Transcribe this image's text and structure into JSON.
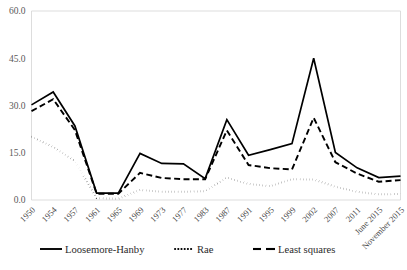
{
  "chart_data": {
    "type": "line",
    "title": "",
    "subtitle": "",
    "xlabel": "",
    "ylabel": "",
    "ylim": [
      0,
      60
    ],
    "yticks": [
      "0.0",
      "15.0",
      "30.0",
      "45.0",
      "60.0"
    ],
    "ytick_values": [
      0,
      15,
      30,
      45,
      60
    ],
    "grid": false,
    "legend_position": "bottom",
    "categories": [
      "1950",
      "1954",
      "1957",
      "1961",
      "1965",
      "1969",
      "1973",
      "1977",
      "1983",
      "1987",
      "1991",
      "1995",
      "1999",
      "2002",
      "2007",
      "2011",
      "June 2015",
      "November 2015"
    ],
    "series": [
      {
        "name": "Loosemore-Hanby",
        "style": "solid",
        "color": "#000000",
        "values": [
          30.2,
          34.3,
          23.5,
          2.2,
          2.2,
          14.8,
          11.6,
          11.5,
          6.8,
          25.5,
          14.2,
          16.0,
          17.9,
          45.0,
          15.1,
          10.2,
          7.1,
          7.6
        ]
      },
      {
        "name": "Rae",
        "style": "dotted",
        "color": "#000000",
        "values": [
          20.1,
          16.8,
          12.4,
          0.6,
          0.4,
          3.2,
          2.6,
          2.6,
          2.8,
          7.1,
          5.1,
          4.4,
          6.6,
          6.5,
          4.2,
          2.6,
          1.8,
          1.9
        ]
      },
      {
        "name": "Least squares",
        "style": "dashed",
        "color": "#000000",
        "values": [
          28.2,
          32.0,
          22.2,
          2.0,
          2.0,
          8.6,
          7.0,
          6.6,
          6.6,
          22.1,
          11.1,
          10.1,
          9.7,
          26.1,
          12.0,
          8.4,
          5.8,
          6.3
        ]
      }
    ],
    "legend": [
      {
        "label": "Loosemore-Hanby",
        "style": "solid"
      },
      {
        "label": "Rae",
        "style": "dotted"
      },
      {
        "label": "Least squares",
        "style": "dashed"
      }
    ]
  },
  "footer": {
    "caption": ""
  }
}
